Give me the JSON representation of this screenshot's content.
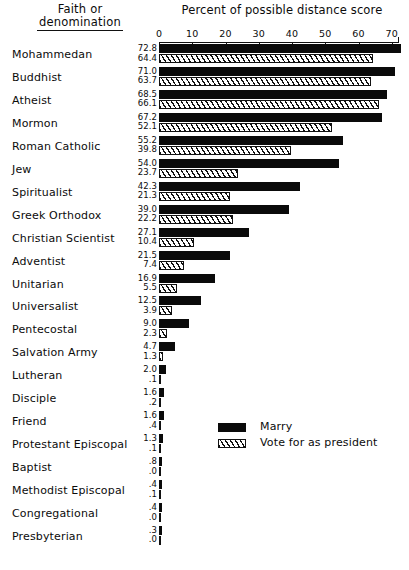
{
  "headers": {
    "faith_line1": "Faith or",
    "faith_line2": "denomination",
    "axis_title": "Percent of possible distance score"
  },
  "legend": {
    "marry_label": "Marry",
    "vote_label": "Vote for as president",
    "marry_swatch": "solid-black-bar-icon",
    "vote_swatch": "diagonal-hatch-bar-icon"
  },
  "colors": {
    "marry": "#0a0a0a",
    "vote_outline": "#111111",
    "background": "#ffffff"
  },
  "chart_data": {
    "type": "bar",
    "title": "Percent of possible distance score",
    "xlabel": "Percent of possible distance score",
    "ylabel": "Faith or denomination",
    "orientation": "horizontal",
    "grid": false,
    "legend_position": "inside-bottom-right",
    "xlim": [
      0,
      72
    ],
    "xticks": [
      0,
      10,
      20,
      30,
      40,
      50,
      60,
      70
    ],
    "xtick_labels": [
      "0",
      "10",
      "20",
      "30",
      "40",
      "50",
      "60",
      "70"
    ],
    "categories": [
      "Mohammedan",
      "Buddhist",
      "Atheist",
      "Mormon",
      "Roman Catholic",
      "Jew",
      "Spiritualist",
      "Greek Orthodox",
      "Christian Scientist",
      "Adventist",
      "Unitarian",
      "Universalist",
      "Pentecostal",
      "Salvation Army",
      "Lutheran",
      "Disciple",
      "Friend",
      "Protestant Episcopal",
      "Baptist",
      "Methodist Episcopal",
      "Congregational",
      "Presbyterian"
    ],
    "series": [
      {
        "name": "Marry",
        "values": [
          72.8,
          71.0,
          68.5,
          67.2,
          55.2,
          54.0,
          42.3,
          39.0,
          27.1,
          21.5,
          16.9,
          12.5,
          9.0,
          4.7,
          2.0,
          1.6,
          1.6,
          1.3,
          0.8,
          0.4,
          0.4,
          0.3
        ],
        "labels": [
          "72.8",
          "71.0",
          "68.5",
          "67.2",
          "55.2",
          "54.0",
          "42.3",
          "39.0",
          "27.1",
          "21.5",
          "16.9",
          "12.5",
          "9.0",
          "4.7",
          "2.0",
          "1.6",
          "1.6",
          "1.3",
          ".8",
          ".4",
          ".4",
          ".3"
        ]
      },
      {
        "name": "Vote for as president",
        "values": [
          64.4,
          63.7,
          66.1,
          52.1,
          39.8,
          23.7,
          21.3,
          22.2,
          10.4,
          7.4,
          5.5,
          3.9,
          2.3,
          1.3,
          0.1,
          0.2,
          0.4,
          0.1,
          0.0,
          0.1,
          0.0,
          0.0
        ],
        "labels": [
          "64.4",
          "63.7",
          "66.1",
          "52.1",
          "39.8",
          "23.7",
          "21.3",
          "22.2",
          "10.4",
          "7.4",
          "5.5",
          "3.9",
          "2.3",
          "1.3",
          ".1",
          ".2",
          ".4",
          ".1",
          ".0",
          ".1",
          ".0",
          ".0"
        ]
      }
    ]
  }
}
